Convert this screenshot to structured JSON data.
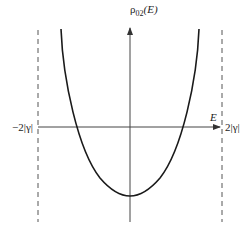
{
  "diagram": {
    "y_axis_label": {
      "symbol": "ρ",
      "subscript": "02",
      "argument": "(E)"
    },
    "x_axis_label": "E",
    "left_bound_label": "−2|γ|",
    "right_bound_label": "2|γ|",
    "colors": {
      "curve": "#1a1a1a",
      "axis": "#444444",
      "dashed": "#555555",
      "text": "#222222"
    }
  }
}
